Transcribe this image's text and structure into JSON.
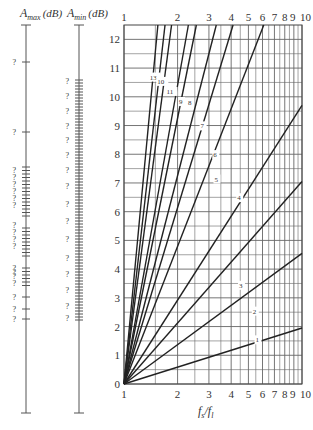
{
  "chart_data": {
    "type": "line",
    "title": "",
    "xlabel": "f_s/f_l",
    "ylabel": "",
    "x_scale": "log",
    "xlim": [
      1,
      10
    ],
    "ylim": [
      0,
      12.5
    ],
    "grid": true,
    "x_ticks": [
      1,
      2,
      3,
      4,
      5,
      6,
      7,
      8,
      9,
      10
    ],
    "x_tick_labels": [
      "1",
      "2",
      "3",
      "4",
      "5",
      "6",
      "7",
      "8",
      "910"
    ],
    "y_ticks": [
      0,
      1,
      2,
      3,
      4,
      5,
      6,
      7,
      8,
      9,
      10,
      11,
      12
    ],
    "y_tick_labels": [
      "0",
      "1",
      "2",
      "3",
      "4",
      "5",
      "6",
      "7",
      "8",
      "9",
      "10",
      "11",
      "12"
    ],
    "side_scales": [
      {
        "name": "A_max (dB)",
        "label_main": "A",
        "label_sub": "max",
        "label_unit": "(dB)",
        "tick_labels": "?"
      },
      {
        "name": "A_min (dB)",
        "label_main": "A",
        "label_sub": "min",
        "label_unit": "(dB)",
        "tick_labels": "?"
      }
    ],
    "series": [
      {
        "name": "1",
        "x": [
          1,
          10
        ],
        "y": [
          0,
          1.95
        ]
      },
      {
        "name": "2",
        "x": [
          1,
          10
        ],
        "y": [
          0,
          4.55
        ]
      },
      {
        "name": "3",
        "x": [
          1,
          10
        ],
        "y": [
          0,
          7.05
        ]
      },
      {
        "name": "4",
        "x": [
          1,
          10
        ],
        "y": [
          0,
          9.7
        ]
      },
      {
        "name": "5",
        "x": [
          1,
          6.1
        ],
        "y": [
          0,
          12.5
        ]
      },
      {
        "name": "6",
        "x": [
          1,
          4.1
        ],
        "y": [
          0,
          12.5
        ]
      },
      {
        "name": "7",
        "x": [
          1,
          3.3
        ],
        "y": [
          0,
          12.5
        ]
      },
      {
        "name": "8",
        "x": [
          1,
          2.55
        ],
        "y": [
          0,
          12.5
        ]
      },
      {
        "name": "9",
        "x": [
          1,
          2.3
        ],
        "y": [
          0,
          12.5
        ]
      },
      {
        "name": "11",
        "x": [
          1,
          1.85
        ],
        "y": [
          0,
          12.5
        ]
      },
      {
        "name": "10",
        "x": [
          1,
          1.7
        ],
        "y": [
          0,
          12.5
        ]
      },
      {
        "name": "13",
        "x": [
          1,
          1.55
        ],
        "y": [
          0,
          12.5
        ]
      }
    ],
    "curve_labels": [
      {
        "text": "13",
        "x": 1.45,
        "y": 10.6
      },
      {
        "text": "10",
        "x": 1.6,
        "y": 10.45
      },
      {
        "text": "11",
        "x": 1.8,
        "y": 10.1
      },
      {
        "text": "9",
        "x": 2.12,
        "y": 9.75
      },
      {
        "text": "8",
        "x": 2.38,
        "y": 9.7
      },
      {
        "text": "7",
        "x": 2.8,
        "y": 8.9
      },
      {
        "text": "6",
        "x": 3.3,
        "y": 7.9
      },
      {
        "text": "5",
        "x": 3.35,
        "y": 7.05
      },
      {
        "text": "4",
        "x": 4.5,
        "y": 6.4
      },
      {
        "text": "3",
        "x": 4.6,
        "y": 3.35
      },
      {
        "text": "2",
        "x": 5.5,
        "y": 2.45
      },
      {
        "text": "1",
        "x": 5.7,
        "y": 1.45
      }
    ]
  },
  "labels": {
    "amax_main": "A",
    "amax_sub": "max",
    "amax_unit": "(dB)",
    "amin_main": "A",
    "amin_sub": "min",
    "amin_unit": "(dB)",
    "xlabel_main": "f",
    "xlabel_sub1": "s",
    "xlabel_slash": "/f",
    "xlabel_sub2": "l",
    "unknown": "?"
  }
}
